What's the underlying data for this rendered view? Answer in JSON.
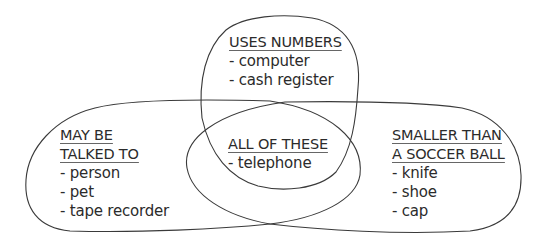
{
  "diagram": {
    "type": "venn",
    "sets": [
      {
        "id": "uses-numbers",
        "heading_lines": [
          "USES NUMBERS"
        ],
        "items": [
          "- computer",
          "- cash register"
        ]
      },
      {
        "id": "may-be-talked-to",
        "heading_lines": [
          "MAY BE",
          "TALKED TO"
        ],
        "items": [
          "- person",
          "- pet",
          "- tape recorder"
        ]
      },
      {
        "id": "all-of-these",
        "heading_lines": [
          "ALL OF THESE"
        ],
        "items": [
          "- telephone"
        ]
      },
      {
        "id": "smaller-than-soccer-ball",
        "heading_lines": [
          "SMALLER THAN",
          "A SOCCER BALL"
        ],
        "items": [
          "- knife",
          "- shoe",
          "- cap"
        ]
      }
    ]
  },
  "colors": {
    "stroke": "#3a3a3a",
    "text": "#2b2b2b",
    "background": "#ffffff"
  }
}
